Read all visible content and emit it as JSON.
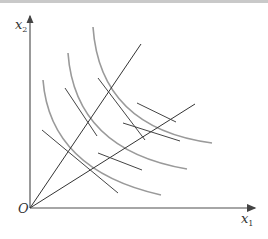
{
  "diagram": {
    "type": "isoquant-map",
    "axes": {
      "x_label": "x",
      "x_sub": "1",
      "y_label": "x",
      "y_sub": "2",
      "origin_label": "O"
    },
    "colors": {
      "axis": "#555555",
      "curve": "#9a9a9a",
      "ray": "#333333",
      "tangent": "#444444"
    },
    "curves": [
      {
        "id": "inner",
        "path": "M43,80 Q50,170 161,195"
      },
      {
        "id": "middle",
        "path": "M68,53 Q75,150 187,169"
      },
      {
        "id": "outer",
        "path": "M93,27 Q100,128 212,143"
      }
    ],
    "rays": [
      {
        "id": "steep",
        "x2": 141,
        "y2": 44
      },
      {
        "id": "shallow",
        "x2": 195,
        "y2": 104
      }
    ],
    "tangents": [
      {
        "id": "t1",
        "x1": 42,
        "y1": 130,
        "x2": 118,
        "y2": 193
      },
      {
        "id": "t2",
        "x1": 98,
        "y1": 78,
        "x2": 145,
        "y2": 140
      },
      {
        "id": "t3",
        "x1": 70,
        "y1": 148,
        "x2": 140,
        "y2": 172
      },
      {
        "id": "t4",
        "x1": 123,
        "y1": 123,
        "x2": 180,
        "y2": 141
      }
    ]
  }
}
